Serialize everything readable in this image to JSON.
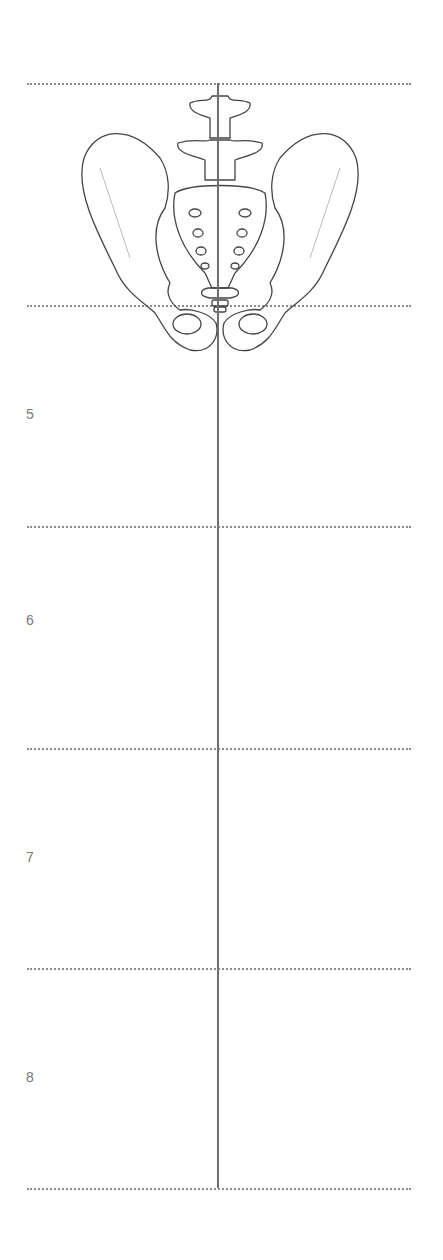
{
  "figure": {
    "guide_lines_y": [
      83,
      305,
      526,
      748,
      968,
      1188
    ],
    "axis_line": {
      "x": 218,
      "y_start": 83,
      "y_end": 1188
    },
    "row_labels": [
      {
        "text": "5",
        "y": 415
      },
      {
        "text": "6",
        "y": 621
      },
      {
        "text": "7",
        "y": 858
      },
      {
        "text": "8",
        "y": 1078
      }
    ],
    "colors": {
      "guide": "#8a8a8a",
      "axis": "#6e6e6e",
      "label": "#777777",
      "sketch": "#444444"
    }
  }
}
